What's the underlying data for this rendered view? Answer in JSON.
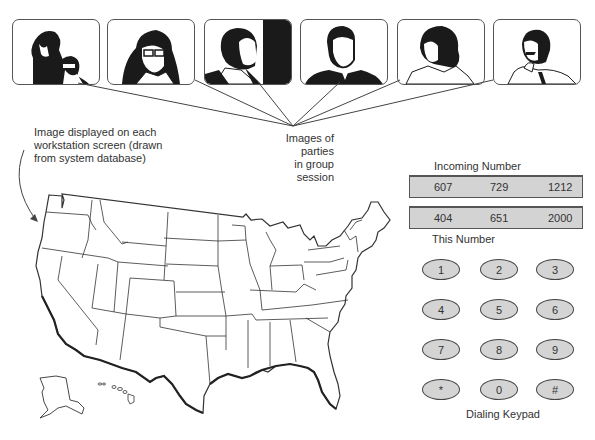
{
  "participants": {
    "label_line1": "Images of parties",
    "label_line2": "in group session",
    "panels": [
      {
        "id": "party-1",
        "desc": "two people, woman and man with glasses"
      },
      {
        "id": "party-2",
        "desc": "woman with glasses"
      },
      {
        "id": "party-3",
        "desc": "man in profile"
      },
      {
        "id": "party-4",
        "desc": "balding man in suit"
      },
      {
        "id": "party-5",
        "desc": "woman with curly hair"
      },
      {
        "id": "party-6",
        "desc": "man with mustache, hand on chin"
      }
    ]
  },
  "map": {
    "caption_line1": "Image displayed on each",
    "caption_line2": "workstation screen (drawn",
    "caption_line3": "from system database)"
  },
  "phone": {
    "incoming_label": "Incoming Number",
    "incoming": {
      "area": "607",
      "prefix": "729",
      "line": "1212"
    },
    "this_label": "This Number",
    "this": {
      "area": "404",
      "prefix": "651",
      "line": "2000"
    },
    "keypad_label": "Dialing Keypad",
    "keys": [
      "1",
      "2",
      "3",
      "4",
      "5",
      "6",
      "7",
      "8",
      "9",
      "*",
      "0",
      "#"
    ]
  },
  "colors": {
    "box_fill": "#d3d3d3",
    "key_fill": "#d4d4d4",
    "line": "#444444"
  }
}
